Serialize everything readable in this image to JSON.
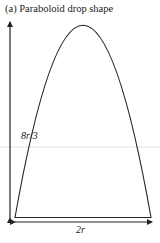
{
  "figure": {
    "title": "(a) Paraboloid drop shape",
    "height_label": "8r/3",
    "width_label": "2r",
    "shape": "paraboloid",
    "colors": {
      "stroke": "#222222",
      "background": "#ffffff",
      "artifact_line": "#e6e6e6"
    }
  }
}
